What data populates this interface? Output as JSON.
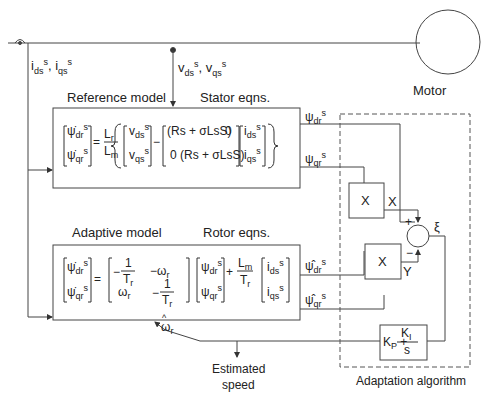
{
  "motor": {
    "label": "Motor"
  },
  "signals": {
    "currents": "i_ds^s, i_qs^s",
    "voltages": "v_ds^s, v_qs^s",
    "psi_dr_ref": "ψdr",
    "psi_qr_ref": "ψqr",
    "psi_dr_adp": "ψdr",
    "psi_qr_adp": "ψqr",
    "omega_hat": "ω",
    "sup_s": "s",
    "sub_dr": "dr",
    "sub_qr": "qr",
    "sub_ds": "ds",
    "sub_qs": "qs",
    "sub_r": "r",
    "hat": "^"
  },
  "reference_model": {
    "title": "Reference model",
    "subtitle": "Stator eqns.",
    "equation": "[ψ̇dr; ψ̇qr] = Lr/Lm { [vds; vqs] − [(Rs + σLsS) 0; 0 (Rs + σLsS)] [ids; iqs] }",
    "term_rs": "(Rs + σLsS)",
    "zero": "0",
    "Lr": "L",
    "Lm": "L"
  },
  "adaptive_model": {
    "title": "Adaptive model",
    "subtitle": "Rotor eqns.",
    "equation": "[ψ̇dr; ψ̇qr] = [−1/Tr −ωr; ωr −1/Tr] [ψdr; ψqr] + Lm/Tr [ids; iqs]",
    "one": "1",
    "T": "T",
    "minus": "−",
    "plus": "+",
    "omega": "ω"
  },
  "adaptation": {
    "label": "Adaptation algorithm",
    "multiplier1": "X",
    "multiplier2": "X",
    "out_x": "X",
    "out_y": "Y",
    "sum_plus": "+",
    "sum_minus": "−",
    "error": "ξ",
    "pi_controller": "K_P + K_I/s",
    "KP": "K",
    "KI": "K"
  },
  "output": {
    "label_line1": "Estimated",
    "label_line2": "speed"
  }
}
